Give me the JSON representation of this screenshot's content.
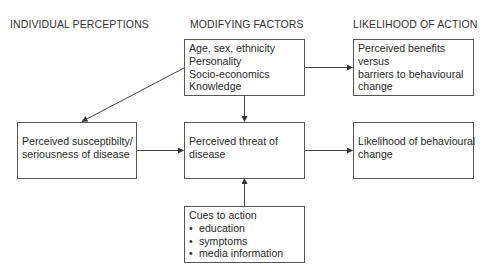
{
  "columns": {
    "left": "INDIVIDUAL PERCEPTIONS",
    "middle": "MODIFYING FACTORS",
    "right": "LIKELIHOOD OF ACTION"
  },
  "boxes": {
    "modifying_factors": {
      "lines": [
        "Age, sex, ethnicity",
        "Personality",
        "Socio-economics",
        "Knowledge"
      ]
    },
    "benefits_barriers": {
      "lines": [
        "Perceived benefits",
        "versus",
        "barriers to behavioural",
        "change"
      ]
    },
    "susceptibility": {
      "lines": [
        "Perceived susceptibilty/",
        "seriousness of disease"
      ]
    },
    "threat": {
      "lines": [
        "Perceived threat of",
        "disease"
      ]
    },
    "likelihood": {
      "lines": [
        "Likelihood of behavioural",
        "change"
      ]
    },
    "cues": {
      "title": "Cues to action",
      "items": [
        "education",
        "symptoms",
        "media information"
      ]
    }
  },
  "connections": [
    {
      "from": "modifying_factors",
      "to": "susceptibility"
    },
    {
      "from": "modifying_factors",
      "to": "threat"
    },
    {
      "from": "modifying_factors",
      "to": "benefits_barriers"
    },
    {
      "from": "susceptibility",
      "to": "threat"
    },
    {
      "from": "threat",
      "to": "likelihood"
    },
    {
      "from": "cues",
      "to": "threat"
    }
  ],
  "colors": {
    "line": "#444444",
    "text": "#2a2a2a",
    "background": "#ffffff"
  }
}
